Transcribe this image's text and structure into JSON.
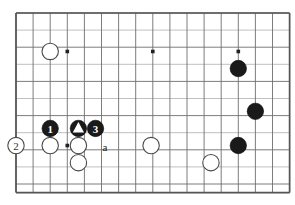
{
  "diagram": {
    "type": "go-board-position",
    "caption": "",
    "board": {
      "origin_x": 16,
      "origin_y": 13,
      "cell": 17.1,
      "cols": 16,
      "rows": 10.5,
      "stone_radius": 8.2,
      "background_color": "#ffffff",
      "line_color": "#6e6e6e",
      "border_color": "#555555"
    },
    "hoshi_points": [
      {
        "col": 3,
        "row": 2.25,
        "name": "star-point-left"
      },
      {
        "col": 8,
        "row": 2.25,
        "name": "star-point-center"
      },
      {
        "col": 13,
        "row": 2.25,
        "name": "star-point-right"
      },
      {
        "col": 3,
        "row": 7.75,
        "name": "star-point-lower-left"
      }
    ],
    "stones": [
      {
        "id": "w-upper-left",
        "color": "white",
        "col": 2,
        "row": 2.25,
        "label": "",
        "marker": ""
      },
      {
        "id": "b-right-upper",
        "color": "black",
        "col": 13,
        "row": 3.25,
        "label": "",
        "marker": ""
      },
      {
        "id": "b-right-middle",
        "color": "black",
        "col": 14,
        "row": 5.75,
        "label": "",
        "marker": ""
      },
      {
        "id": "b-right-lower",
        "color": "black",
        "col": 13,
        "row": 7.75,
        "label": "",
        "marker": ""
      },
      {
        "id": "b-move-1",
        "color": "black",
        "col": 2,
        "row": 6.75,
        "label": "1",
        "marker": ""
      },
      {
        "id": "w-move-2",
        "color": "white",
        "col": 0,
        "row": 7.75,
        "label": "2",
        "marker": ""
      },
      {
        "id": "w-left-base",
        "color": "white",
        "col": 2,
        "row": 7.75,
        "label": "",
        "marker": ""
      },
      {
        "id": "b-marked-triangle",
        "color": "black",
        "col": 3.65,
        "row": 6.75,
        "label": "",
        "marker": "triangle"
      },
      {
        "id": "b-move-3",
        "color": "black",
        "col": 4.65,
        "row": 6.75,
        "label": "3",
        "marker": ""
      },
      {
        "id": "w-center-base",
        "color": "white",
        "col": 3.65,
        "row": 7.75,
        "label": "",
        "marker": ""
      },
      {
        "id": "w-center-below",
        "color": "white",
        "col": 3.65,
        "row": 8.75,
        "label": "",
        "marker": ""
      },
      {
        "id": "w-mid-right",
        "color": "white",
        "col": 7.9,
        "row": 7.75,
        "label": "",
        "marker": ""
      },
      {
        "id": "w-bottom-right",
        "color": "white",
        "col": 11.4,
        "row": 8.75,
        "label": "",
        "marker": ""
      }
    ],
    "point_labels": [
      {
        "id": "point-a",
        "text": "a",
        "col": 5.2,
        "row": 7.85
      }
    ]
  }
}
